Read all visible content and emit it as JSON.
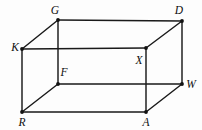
{
  "figure": {
    "kind": "rectangular-prism-diagram",
    "background_color": "#fdfdfd",
    "line_color": "#1a1a1a",
    "label_color": "#0d0d0d",
    "canvas": {
      "width": 202,
      "height": 130
    }
  },
  "vertices": [
    {
      "id": "G",
      "label": "G",
      "x": 58,
      "y": 20,
      "label_x": 55,
      "label_y": 14,
      "anchor": "middle"
    },
    {
      "id": "D",
      "label": "D",
      "x": 182,
      "y": 21,
      "label_x": 179,
      "label_y": 14,
      "anchor": "middle"
    },
    {
      "id": "K",
      "label": "K",
      "x": 22,
      "y": 49,
      "label_x": 15,
      "label_y": 51,
      "anchor": "middle"
    },
    {
      "id": "X",
      "label": "X",
      "x": 146,
      "y": 48,
      "label_x": 139,
      "label_y": 64,
      "anchor": "middle"
    },
    {
      "id": "F",
      "label": "F",
      "x": 58,
      "y": 84,
      "label_x": 64,
      "label_y": 76,
      "anchor": "middle"
    },
    {
      "id": "W",
      "label": "W",
      "x": 182,
      "y": 84,
      "label_x": 191,
      "label_y": 88,
      "anchor": "middle"
    },
    {
      "id": "R",
      "label": "R",
      "x": 22,
      "y": 112,
      "label_x": 22,
      "label_y": 126,
      "anchor": "middle"
    },
    {
      "id": "A",
      "label": "A",
      "x": 146,
      "y": 112,
      "label_x": 146,
      "label_y": 126,
      "anchor": "middle"
    }
  ],
  "edges": [
    {
      "id": "G-D",
      "from": "G",
      "to": "D",
      "x1": 58,
      "y1": 20,
      "x2": 182,
      "y2": 21
    },
    {
      "id": "G-K",
      "from": "G",
      "to": "K",
      "x1": 58,
      "y1": 20,
      "x2": 22,
      "y2": 49
    },
    {
      "id": "G-F",
      "from": "G",
      "to": "F",
      "x1": 58,
      "y1": 20,
      "x2": 58,
      "y2": 84
    },
    {
      "id": "D-X",
      "from": "D",
      "to": "X",
      "x1": 182,
      "y1": 21,
      "x2": 146,
      "y2": 48
    },
    {
      "id": "D-W",
      "from": "D",
      "to": "W",
      "x1": 182,
      "y1": 21,
      "x2": 182,
      "y2": 84
    },
    {
      "id": "K-X",
      "from": "K",
      "to": "X",
      "x1": 22,
      "y1": 49,
      "x2": 146,
      "y2": 48
    },
    {
      "id": "K-R",
      "from": "K",
      "to": "R",
      "x1": 22,
      "y1": 49,
      "x2": 22,
      "y2": 112
    },
    {
      "id": "X-A",
      "from": "X",
      "to": "A",
      "x1": 146,
      "y1": 48,
      "x2": 146,
      "y2": 112
    },
    {
      "id": "F-W",
      "from": "F",
      "to": "W",
      "x1": 58,
      "y1": 84,
      "x2": 182,
      "y2": 84
    },
    {
      "id": "F-R",
      "from": "F",
      "to": "R",
      "x1": 58,
      "y1": 84,
      "x2": 22,
      "y2": 112
    },
    {
      "id": "R-A",
      "from": "R",
      "to": "A",
      "x1": 22,
      "y1": 112,
      "x2": 146,
      "y2": 112
    },
    {
      "id": "A-W",
      "from": "A",
      "to": "W",
      "x1": 146,
      "y1": 112,
      "x2": 182,
      "y2": 84
    }
  ],
  "vertex_dot_radius": 1.9
}
